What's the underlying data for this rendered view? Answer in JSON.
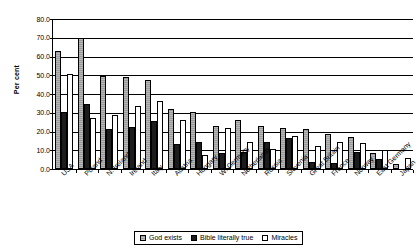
{
  "chart_data": {
    "type": "bar",
    "title": "",
    "xlabel": "",
    "ylabel": "Per cent",
    "ylim": [
      0,
      80
    ],
    "ytick_step": 10,
    "ytick_labels": [
      "0.0",
      "10.0",
      "20.0",
      "30.0",
      "40.0",
      "50.0",
      "60.0",
      "70.0",
      "80.0"
    ],
    "grid": true,
    "legend_position": "bottom-center",
    "categories": [
      "USA",
      "Poland",
      "N. Ireland",
      "Ireland",
      "Italy",
      "Austria",
      "Hungary",
      "W. Germany",
      "Netherlands",
      "Russia",
      "Slovenia",
      "Great Britain",
      "France",
      "Norway",
      "East Germany",
      "Japan"
    ],
    "series": [
      {
        "name": "God exists",
        "color": "#9a9a9a",
        "values": [
          62.8,
          70.0,
          49.5,
          49.3,
          47.5,
          31.8,
          30.6,
          22.8,
          26.0,
          22.9,
          22.0,
          21.5,
          18.8,
          17.1,
          8.5,
          2.9
        ]
      },
      {
        "name": "Bible literally true",
        "color": "#1c1c1c",
        "values": [
          30.5,
          34.5,
          21.2,
          22.4,
          25.7,
          13.6,
          14.3,
          8.8,
          9.2,
          14.4,
          16.6,
          3.9,
          3.2,
          9.0,
          5.3,
          0.0
        ]
      },
      {
        "name": "Miracles",
        "color": "#ffffff",
        "values": [
          50.8,
          27.2,
          29.0,
          33.6,
          36.4,
          26.1,
          7.5,
          22.0,
          14.2,
          10.8,
          17.6,
          12.5,
          14.2,
          14.1,
          10.2,
          5.7
        ]
      }
    ]
  }
}
